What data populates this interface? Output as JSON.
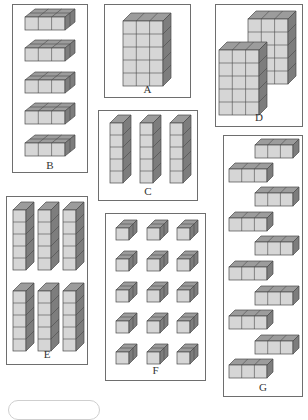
{
  "figure": {
    "colors": {
      "front": "#d6d6d6",
      "top": "#9c9c9c",
      "side": "#7d7d7d",
      "edge": "#4a4a4a",
      "panel_border": "#6e6e6e"
    },
    "panels": [
      {
        "id": "A",
        "label": "A",
        "arrangement": "one block 3 wide x 5 tall x 1 deep",
        "groups": 1,
        "cubes_per_group": 15
      },
      {
        "id": "B",
        "label": "B",
        "arrangement": "5 slabs, each 3 wide x 1 tall x 2 deep",
        "groups": 5,
        "cubes_per_group": 3
      },
      {
        "id": "C",
        "label": "C",
        "arrangement": "3 columns, each 1 wide x 5 tall",
        "groups": 3,
        "cubes_per_group": 5
      },
      {
        "id": "D",
        "label": "D",
        "arrangement": "2 blocks, each 3 wide x 5 tall (staggered)",
        "groups": 2,
        "cubes_per_group": 15
      },
      {
        "id": "E",
        "label": "E",
        "arrangement": "6 columns (2 rows of 3), each 1 wide x 5 tall",
        "groups": 6,
        "cubes_per_group": 5
      },
      {
        "id": "F",
        "label": "F",
        "arrangement": "15 pairs of cubes in 5 rows x 3 columns",
        "groups": 15,
        "cubes_per_group": 2
      },
      {
        "id": "G",
        "label": "G",
        "arrangement": "10 rods of 3 cubes, alternating offset",
        "groups": 10,
        "cubes_per_group": 3
      }
    ]
  }
}
